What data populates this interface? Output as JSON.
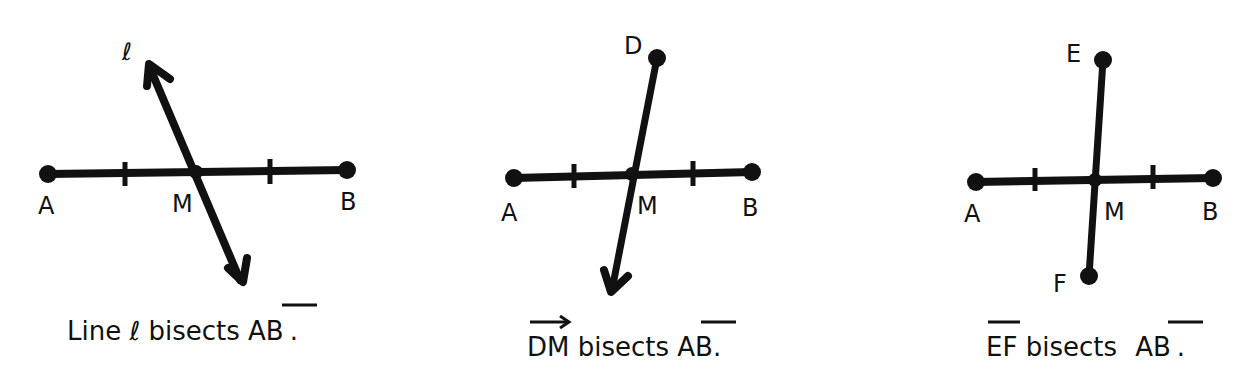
{
  "panels": [
    {
      "id": "line-l",
      "points": {
        "A": "A",
        "B": "B",
        "M": "M"
      },
      "bisector_label": "ℓ",
      "caption": {
        "prefix": "Line ",
        "symbol": "ℓ",
        "middle": " bisects ",
        "segment": "AB",
        "suffix": "."
      }
    },
    {
      "id": "ray-dm",
      "points": {
        "A": "A",
        "B": "B",
        "M": "M",
        "D": "D"
      },
      "caption": {
        "ray": "DM",
        "middle": " bisects ",
        "segment": "AB",
        "suffix": "."
      }
    },
    {
      "id": "segment-ef",
      "points": {
        "A": "A",
        "B": "B",
        "M": "M",
        "E": "E",
        "F": "F"
      },
      "caption": {
        "segment1": "EF",
        "middle": " bisects ",
        "segment": "AB",
        "suffix": "."
      }
    }
  ],
  "colors": {
    "ink": "#111111",
    "background": "#ffffff"
  }
}
